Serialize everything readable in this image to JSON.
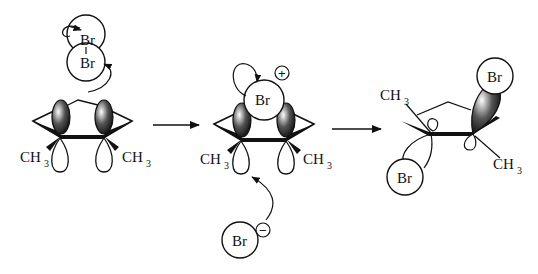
{
  "diagram": {
    "type": "reaction-mechanism",
    "steps": [
      {
        "id": "reactants",
        "labels": {
          "br_top": "Br",
          "br_bottom": "Br",
          "methyl_left": "CH",
          "methyl_left_sub": "3",
          "methyl_right": "CH",
          "methyl_right_sub": "3"
        }
      },
      {
        "id": "bromonium-intermediate",
        "labels": {
          "br": "Br",
          "charge": "+",
          "methyl_left": "CH",
          "methyl_left_sub": "3",
          "methyl_right": "CH",
          "methyl_right_sub": "3",
          "bromide": "Br",
          "bromide_charge": "−"
        }
      },
      {
        "id": "product",
        "labels": {
          "br_top": "Br",
          "br_bottom": "Br",
          "methyl_top": "CH",
          "methyl_top_sub": "3",
          "methyl_bottom": "CH",
          "methyl_bottom_sub": "3"
        }
      }
    ],
    "arrows": [
      "reaction-arrow-1",
      "reaction-arrow-2"
    ],
    "colors": {
      "ink": "#111111",
      "background": "#ffffff"
    }
  }
}
